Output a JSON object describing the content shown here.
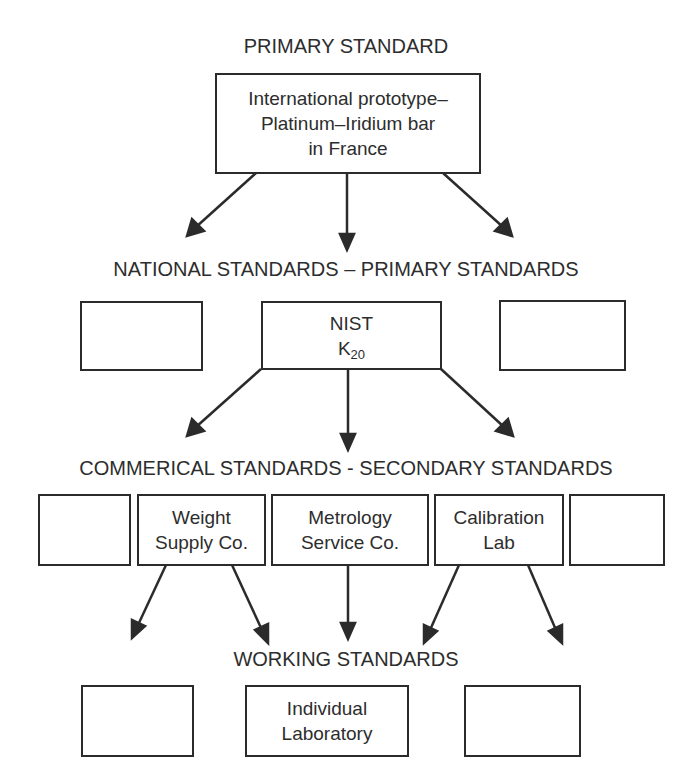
{
  "diagram": {
    "levels": {
      "primary": {
        "label": "PRIMARY STANDARD",
        "boxes": [
          {
            "lines": [
              "International prototype–",
              "Platinum–Iridium bar",
              "in France"
            ]
          }
        ]
      },
      "national": {
        "label": "NATIONAL STANDARDS – PRIMARY STANDARDS",
        "boxes": [
          {
            "lines": []
          },
          {
            "line1": "NIST",
            "line2_main": "K",
            "line2_sub": "20"
          },
          {
            "lines": []
          }
        ]
      },
      "commercial": {
        "label": "COMMERICAL STANDARDS - SECONDARY STANDARDS",
        "boxes": [
          {
            "lines": []
          },
          {
            "line1": "Weight",
            "line2": "Supply Co."
          },
          {
            "line1": "Metrology",
            "line2": "Service Co."
          },
          {
            "line1": "Calibration",
            "line2": "Lab"
          },
          {
            "lines": []
          }
        ]
      },
      "working": {
        "label": "WORKING STANDARDS",
        "boxes": [
          {
            "lines": []
          },
          {
            "line1": "Individual",
            "line2": "Laboratory"
          },
          {
            "lines": []
          }
        ]
      }
    },
    "arrows": [
      {
        "from": "primary",
        "to": "national",
        "count": 3
      },
      {
        "from": "NIST K20",
        "to": "commercial",
        "count": 3
      },
      {
        "from": "Weight Supply Co.",
        "to": "working",
        "count": 2
      },
      {
        "from": "Metrology Service Co.",
        "to": "working",
        "count": 1
      },
      {
        "from": "Calibration Lab",
        "to": "working",
        "count": 2
      }
    ],
    "colors": {
      "line": "#2b2b2b",
      "text": "#2d2d2d",
      "background": "#ffffff"
    }
  }
}
